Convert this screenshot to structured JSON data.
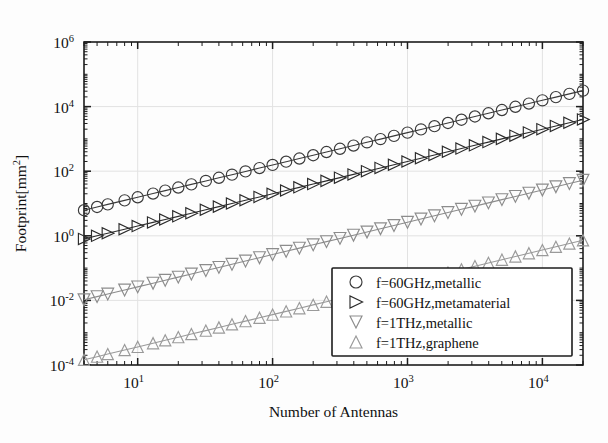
{
  "chart_data": {
    "type": "line",
    "title": "",
    "xlabel": "Number of Antennas",
    "ylabel": "Footprint[mm²]",
    "ylabel_base": "Footprint[mm",
    "ylabel_exp": "2",
    "ylabel_close": "]",
    "xscale": "log",
    "yscale": "log",
    "xlim": [
      4,
      20000
    ],
    "ylim": [
      0.0001,
      1000000
    ],
    "grid": true,
    "legend_position": "lower-right",
    "x_ticks": [
      {
        "value": 10,
        "label": "10",
        "exp": "1"
      },
      {
        "value": 100,
        "label": "10",
        "exp": "2"
      },
      {
        "value": 1000,
        "label": "10",
        "exp": "3"
      },
      {
        "value": 10000,
        "label": "10",
        "exp": "4"
      }
    ],
    "y_ticks": [
      {
        "value": 0.0001,
        "label": "10",
        "exp": "-4"
      },
      {
        "value": 0.01,
        "label": "10",
        "exp": "-2"
      },
      {
        "value": 1,
        "label": "10",
        "exp": "0"
      },
      {
        "value": 100,
        "label": "10",
        "exp": "2"
      },
      {
        "value": 10000,
        "label": "10",
        "exp": "4"
      },
      {
        "value": 1000000,
        "label": "10",
        "exp": "6"
      }
    ],
    "x": [
      4,
      5,
      6,
      8,
      10,
      13,
      16,
      20,
      25,
      32,
      40,
      50,
      63,
      80,
      100,
      126,
      158,
      200,
      251,
      316,
      398,
      501,
      631,
      794,
      1000,
      1259,
      1585,
      1995,
      2512,
      3162,
      3981,
      5012,
      6310,
      7943,
      10000,
      12589,
      15849,
      20000
    ],
    "series": [
      {
        "name": "f=60GHz,metallic",
        "marker": "circle",
        "color": "#3a3a3a",
        "values": [
          6.2,
          7.8,
          9.4,
          12.5,
          15.6,
          20.3,
          25.0,
          31.2,
          39.1,
          50.0,
          62.5,
          78.1,
          98.4,
          125.0,
          156.2,
          196.9,
          246.9,
          312.5,
          392.2,
          493.8,
          621.9,
          782.8,
          985.9,
          1240.6,
          1562.5,
          1967.2,
          2476.6,
          3117.2,
          3925.0,
          4940.6,
          6220.3,
          7831.2,
          9859.4,
          12410.9,
          15625.0,
          19670.3,
          24764.1,
          31250.0
        ]
      },
      {
        "name": "f=60GHz,metamaterial",
        "marker": "triangle-right",
        "color": "#2b2b2b",
        "values": [
          0.8,
          1.0,
          1.2,
          1.6,
          2.0,
          2.6,
          3.2,
          4.0,
          5.0,
          6.4,
          8.0,
          10.0,
          12.6,
          16.0,
          20.0,
          25.2,
          31.6,
          40.0,
          50.2,
          63.2,
          79.6,
          100.2,
          126.2,
          158.8,
          200.0,
          251.8,
          317.0,
          399.0,
          502.4,
          632.4,
          796.2,
          1002.4,
          1262.0,
          1588.6,
          2000.0,
          2517.8,
          3169.8,
          4000.0
        ]
      },
      {
        "name": "f=1THz,metallic",
        "marker": "triangle-down",
        "color": "#8c8c8c",
        "values": [
          0.0105,
          0.0131,
          0.0157,
          0.021,
          0.0262,
          0.0341,
          0.042,
          0.0525,
          0.0656,
          0.084,
          0.105,
          0.1312,
          0.1653,
          0.21,
          0.2625,
          0.3307,
          0.4147,
          0.525,
          0.6589,
          0.8295,
          1.0447,
          1.3151,
          1.6564,
          2.0843,
          2.625,
          3.3049,
          4.1606,
          5.2369,
          6.594,
          8.3003,
          10.4501,
          13.1565,
          16.5638,
          20.8504,
          26.25,
          33.0461,
          41.6036,
          52.5
        ]
      },
      {
        "name": "f=1THz,graphene",
        "marker": "triangle-up",
        "color": "#9a9a9a",
        "values": [
          0.000145,
          0.000181,
          0.000218,
          0.00029,
          0.000363,
          0.000472,
          0.000581,
          0.000726,
          0.000907,
          0.001161,
          0.001452,
          0.001815,
          0.002287,
          0.002904,
          0.00363,
          0.004574,
          0.005735,
          0.00726,
          0.009111,
          0.011472,
          0.014447,
          0.018186,
          0.022905,
          0.028822,
          0.0363,
          0.045702,
          0.057535,
          0.072419,
          0.091186,
          0.114781,
          0.14451,
          0.181936,
          0.229053,
          0.288331,
          0.363,
          0.457,
          0.575,
          0.726
        ]
      }
    ],
    "legend": [
      {
        "label": "f=60GHz,metallic",
        "marker": "circle",
        "color": "#3a3a3a"
      },
      {
        "label": "f=60GHz,metamaterial",
        "marker": "triangle-right",
        "color": "#2b2b2b"
      },
      {
        "label": "f=1THz,metallic",
        "marker": "triangle-down",
        "color": "#8c8c8c"
      },
      {
        "label": "f=1THz,graphene",
        "marker": "triangle-up",
        "color": "#9a9a9a"
      }
    ]
  }
}
